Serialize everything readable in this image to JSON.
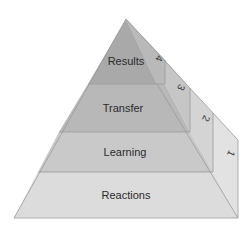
{
  "diagram": {
    "type": "stepped-pyramid",
    "levels": [
      {
        "number": "4",
        "label": "Results",
        "front_color": "#a9a9a9",
        "side_color": "#b9b9b9"
      },
      {
        "number": "3",
        "label": "Transfer",
        "front_color": "#b8b8b8",
        "side_color": "#c6c6c6"
      },
      {
        "number": "2",
        "label": "Learning",
        "front_color": "#c9c9c9",
        "side_color": "#d4d4d4"
      },
      {
        "number": "1",
        "label": "Reactions",
        "front_color": "#dcdcdc",
        "side_color": "#e2e2e2"
      }
    ],
    "edge_color": "#9a9a9a"
  }
}
